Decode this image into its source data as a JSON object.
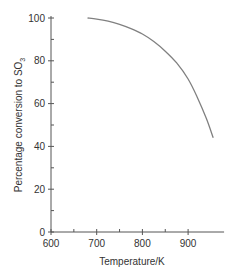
{
  "chart_data": {
    "type": "line",
    "title": "",
    "xlabel": "Temperature/K",
    "ylabel": "Percentage conversion to SO",
    "ylabel_subscript": "3",
    "xlim": [
      600,
      970
    ],
    "ylim": [
      0,
      100
    ],
    "x_ticks": [
      600,
      700,
      800,
      900
    ],
    "x_tick_labels": [
      "600",
      "700",
      "800",
      "900"
    ],
    "x_minor_ticks": [
      650,
      750,
      850
    ],
    "y_ticks": [
      0,
      20,
      40,
      60,
      80,
      100
    ],
    "y_tick_labels": [
      "0",
      "20",
      "40",
      "60",
      "80",
      "100"
    ],
    "y_minor_ticks": [
      10,
      30,
      50,
      70,
      90
    ],
    "grid": false,
    "legend": null,
    "series": [
      {
        "name": "Conversion to SO3",
        "color": "#808080",
        "x": [
          680,
          700,
          725,
          750,
          775,
          800,
          825,
          850,
          875,
          900,
          920,
          940,
          955
        ],
        "values": [
          100,
          99.5,
          98.5,
          97,
          95,
          92.5,
          89,
          84.5,
          79,
          71.5,
          63,
          53,
          44
        ]
      }
    ]
  }
}
